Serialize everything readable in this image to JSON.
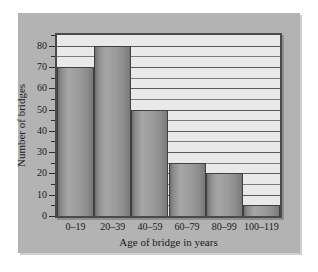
{
  "chart_data": {
    "type": "bar",
    "title": "",
    "subtitle": "",
    "categories": [
      "0–19",
      "20–39",
      "40–59",
      "60–79",
      "80–99",
      "100–119"
    ],
    "values": [
      70,
      80,
      50,
      25,
      20,
      5
    ],
    "xlabel": "Age of bridge in years",
    "ylabel": "Number of bridges",
    "ylim": [
      0,
      85
    ],
    "ytick_labels": [
      "0",
      "10",
      "20",
      "30",
      "40",
      "50",
      "60",
      "70",
      "80"
    ],
    "ytick_values": [
      0,
      10,
      20,
      30,
      40,
      50,
      60,
      70,
      80
    ],
    "yminor_step": 5,
    "grid": "horizontal",
    "legend": "none",
    "annotations": []
  },
  "style": {
    "panel_background": "#b3b3b3",
    "plot_background": "#e9e9e9",
    "bar_color": "#9b9b9b",
    "bar_edge_color": "#3f3f3f",
    "gridline_color": "#5a5a5a",
    "axis_color": "#2e2e2e",
    "text_color": "#1a1a1a",
    "figure_background": "#ffffff"
  }
}
